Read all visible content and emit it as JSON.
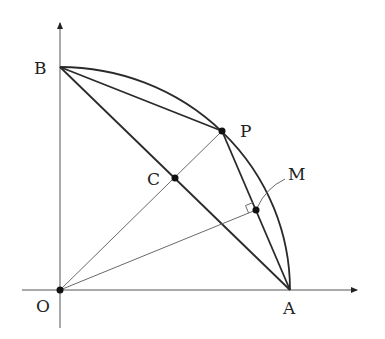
{
  "figure": {
    "type": "geometry-diagram",
    "points": [
      {
        "id": "O",
        "label": "O"
      },
      {
        "id": "A",
        "label": "A"
      },
      {
        "id": "B",
        "label": "B"
      },
      {
        "id": "P",
        "label": "P"
      },
      {
        "id": "C",
        "label": "C"
      },
      {
        "id": "M",
        "label": "M"
      }
    ],
    "segments": [
      {
        "from": "B",
        "to": "P",
        "style": "thick"
      },
      {
        "from": "P",
        "to": "A",
        "style": "thick"
      },
      {
        "from": "B",
        "to": "A",
        "style": "thick"
      },
      {
        "from": "O",
        "to": "P",
        "style": "thin"
      },
      {
        "from": "O",
        "to": "M",
        "style": "thin"
      }
    ],
    "arc": {
      "from": "B",
      "to": "A",
      "center": "O"
    },
    "right_angle_at": "M",
    "axes": {
      "x": true,
      "y": true
    }
  },
  "labels": {
    "O": "O",
    "A": "A",
    "B": "B",
    "P": "P",
    "C": "C",
    "M": "M"
  }
}
